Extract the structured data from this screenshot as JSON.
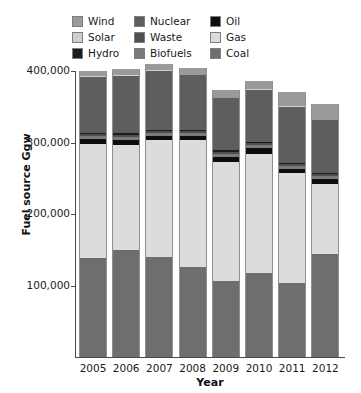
{
  "chart_data": {
    "type": "bar",
    "subtype": "stacked-bar",
    "title": "",
    "xlabel": "Year",
    "ylabel": "Fuel source Ggw",
    "categories": [
      "2005",
      "2006",
      "2007",
      "2008",
      "2009",
      "2010",
      "2011",
      "2012"
    ],
    "ylim": [
      0,
      400000
    ],
    "yticks": [
      0,
      100000,
      200000,
      300000,
      400000
    ],
    "ytick_labels": [
      "0",
      "100,000",
      "200,000",
      "300,000",
      "400,000"
    ],
    "grid": false,
    "legend_position": "top",
    "stack_order_bottom_to_top": [
      "Coal",
      "Gas",
      "Oil",
      "Biofuels",
      "Waste",
      "Hydro",
      "Nuclear",
      "Solar",
      "Wind"
    ],
    "series": [
      {
        "name": "Coal",
        "color": "#6e6e6e",
        "values": [
          138000,
          150000,
          140000,
          126000,
          107000,
          117000,
          104000,
          145000
        ]
      },
      {
        "name": "Gas",
        "color": "#dcdcdc",
        "values": [
          160000,
          147000,
          163000,
          177000,
          166000,
          167000,
          153000,
          98000
        ]
      },
      {
        "name": "Oil",
        "color": "#0d0d0d",
        "values": [
          7000,
          7000,
          6000,
          6000,
          7000,
          8000,
          6000,
          7000
        ]
      },
      {
        "name": "Biofuels",
        "color": "#7a7a7a",
        "values": [
          4000,
          4000,
          4000,
          4000,
          4000,
          4000,
          4000,
          4000
        ]
      },
      {
        "name": "Waste",
        "color": "#4f4f4f",
        "values": [
          3000,
          3000,
          3000,
          3000,
          3000,
          3000,
          3000,
          3000
        ]
      },
      {
        "name": "Hydro",
        "color": "#1c1c1c",
        "values": [
          2000,
          2000,
          2000,
          2000,
          2000,
          2000,
          2000,
          2000
        ]
      },
      {
        "name": "Nuclear",
        "color": "#5e5e5e",
        "values": [
          78000,
          80000,
          82000,
          76000,
          73000,
          73000,
          78000,
          74000
        ]
      },
      {
        "name": "Solar",
        "color": "#cfcfcf",
        "values": [
          1000,
          1000,
          1000,
          1000,
          1000,
          1000,
          1000,
          1000
        ]
      },
      {
        "name": "Wind",
        "color": "#9a9a9a",
        "values": [
          7000,
          9000,
          9000,
          9000,
          11000,
          11000,
          20000,
          22000
        ]
      }
    ],
    "totals": [
      400000,
      403000,
      410000,
      404000,
      374000,
      386000,
      371000,
      354000
    ]
  },
  "legend": {
    "items": [
      {
        "label": "Wind",
        "color": "#9a9a9a"
      },
      {
        "label": "Solar",
        "color": "#cfcfcf"
      },
      {
        "label": "Hydro",
        "color": "#1c1c1c"
      },
      {
        "label": "Nuclear",
        "color": "#5e5e5e"
      },
      {
        "label": "Waste",
        "color": "#4f4f4f"
      },
      {
        "label": "Biofuels",
        "color": "#7a7a7a"
      },
      {
        "label": "Oil",
        "color": "#0d0d0d"
      },
      {
        "label": "Gas",
        "color": "#dcdcdc"
      },
      {
        "label": "Coal",
        "color": "#6e6e6e"
      }
    ]
  },
  "axes": {
    "y_title": "Fuel source Ggw",
    "x_title": "Year",
    "y_labels": [
      "400,000",
      "300,000",
      "200,000",
      "100,000"
    ],
    "x_labels": [
      "2005",
      "2006",
      "2007",
      "2008",
      "2009",
      "2010",
      "2011",
      "2012"
    ]
  }
}
